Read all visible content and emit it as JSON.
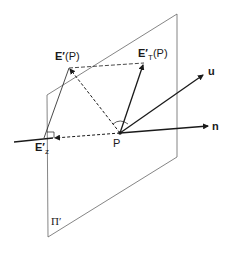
{
  "diagram": {
    "colors": {
      "stroke": "#1a1a1a",
      "plane": "#555555",
      "background": "#ffffff"
    },
    "plane": {
      "label": "Π′",
      "corners": [
        [
          47,
          95
        ],
        [
          177,
          14
        ],
        [
          177,
          157
        ],
        [
          48,
          237
        ]
      ]
    },
    "point_P": {
      "label": "P",
      "x": 120,
      "y": 133
    },
    "vectors": {
      "n": {
        "label": "n",
        "tip": [
          210,
          126
        ],
        "style": "solid"
      },
      "u": {
        "label": "u",
        "tip": [
          205,
          74
        ],
        "style": "solid"
      },
      "E_T": {
        "label_main": "E′",
        "label_sub": "T",
        "label_suffix": "(P)",
        "tip": [
          144,
          63
        ],
        "style": "solid"
      },
      "E_P": {
        "label_main": "E′",
        "label_suffix": "(P)",
        "tip": [
          69,
          68
        ],
        "style": "dashed"
      },
      "E_z": {
        "label_main": "E′",
        "label_sub": "z",
        "tip": [
          53,
          138
        ],
        "style": "dashed"
      }
    },
    "normal_line_left_start": [
      14,
      142
    ],
    "right_angle_markers": [
      "at P between n and E′T",
      "at E′z"
    ]
  }
}
